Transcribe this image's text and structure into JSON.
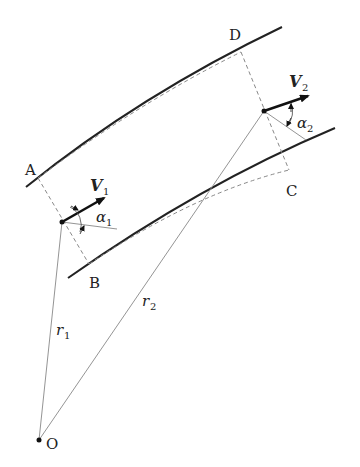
{
  "diagram": {
    "type": "flow-through-curved-channel",
    "points": {
      "A": "A",
      "B": "B",
      "C": "C",
      "D": "D",
      "O": "O"
    },
    "vectors": {
      "v1": "V",
      "v1_sub": "1",
      "v2": "V",
      "v2_sub": "2"
    },
    "angles": {
      "a1": "α",
      "a1_sub": "1",
      "a2": "α",
      "a2_sub": "2"
    },
    "radii": {
      "r1": "r",
      "r1_sub": "1",
      "r2": "r",
      "r2_sub": "2"
    },
    "colors": {
      "wall": "#222222",
      "dashed": "#777777",
      "thin": "#888888",
      "arrow": "#111111"
    }
  }
}
